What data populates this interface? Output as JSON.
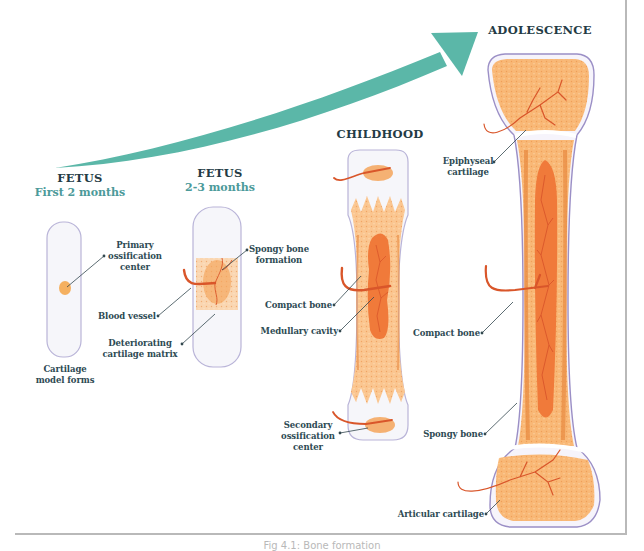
{
  "diagram": {
    "type": "bone-development-stages",
    "colors": {
      "arrow": "#5bb7a8",
      "label_text": "#2d4a53",
      "stage_subtitle": "#4c9a9a",
      "bone_orange": "#f5a55a",
      "bone_light": "#fbd3a8",
      "cavity": "#f07a3a",
      "vessel": "#d9562a",
      "cartilage": "#f6f6fa",
      "outline": "#9b8fc6"
    },
    "stages": [
      {
        "title": "FETUS",
        "subtitle": "First 2 months",
        "labels": {
          "primary_ossification": "Primary ossification center",
          "primary_ossification_lines": [
            "Primary",
            "ossification",
            "center"
          ],
          "bottom_lines": [
            "Cartilage",
            "model forms"
          ]
        }
      },
      {
        "title": "FETUS",
        "subtitle": "2-3 months",
        "labels": {
          "spongy_lines": [
            "Spongy bone",
            "formation"
          ],
          "blood_vessel": "Blood vessel",
          "deteriorating_lines": [
            "Deteriorating",
            "cartilage matrix"
          ]
        }
      },
      {
        "title": "CHILDHOOD",
        "labels": {
          "compact_bone": "Compact bone",
          "medullary_cavity": "Medullary cavity",
          "secondary_lines": [
            "Secondary",
            "ossification",
            "center"
          ]
        }
      },
      {
        "title": "ADOLESCENCE",
        "labels": {
          "epiphyseal_lines": [
            "Epiphyseal",
            "cartilage"
          ],
          "compact_bone": "Compact bone",
          "spongy_bone": "Spongy bone",
          "articular_cartilage": "Articular cartilage"
        }
      }
    ],
    "caption": "Fig 4.1: Bone formation"
  }
}
